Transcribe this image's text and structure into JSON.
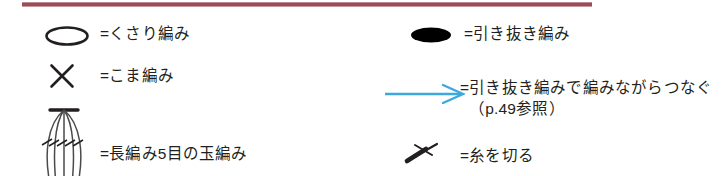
{
  "sheet": {
    "title": "編み目記号の凡例",
    "divider_color": "#9e4b57",
    "ink_color": "#231f20",
    "accent_color": "#3ba9dc",
    "background_color": "#ffffff"
  },
  "columns": {
    "left": {
      "entries": [
        {
          "symbol_name": "chain-stitch-symbol",
          "symbol_glyph": "open-ellipse",
          "label": "=くさり編み"
        },
        {
          "symbol_name": "single-crochet-symbol",
          "symbol_glyph": "x-cross",
          "label": "=こま編み"
        },
        {
          "symbol_name": "bobble-stitch-symbol",
          "symbol_glyph": "five-double-crochet-bobble",
          "label": "=長編み5目の玉編み"
        }
      ]
    },
    "right": {
      "entries": [
        {
          "symbol_name": "slip-stitch-symbol",
          "symbol_glyph": "filled-ellipse",
          "label": "=引き抜き編み"
        },
        {
          "symbol_name": "join-while-crocheting-symbol",
          "symbol_glyph": "blue-arrow-right",
          "label": "=引き抜き編みで編みながらつなぐ",
          "label_sub": "（p.49参照）"
        },
        {
          "symbol_name": "cut-yarn-symbol",
          "symbol_glyph": "cut-arrow",
          "label": "=糸を切る"
        }
      ]
    }
  }
}
